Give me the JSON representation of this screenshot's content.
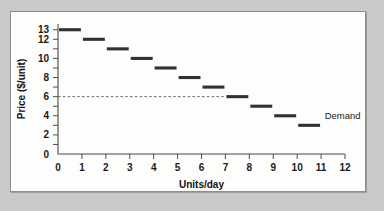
{
  "chart_data": {
    "type": "bar",
    "subtype": "step-demand-schedule",
    "title": "",
    "xlabel": "Units/day",
    "ylabel": "Price ($/unit)",
    "xlim": [
      0,
      12
    ],
    "ylim": [
      0,
      13.6
    ],
    "grid": false,
    "legend_position": "inline-right",
    "x_tick_labels": [
      "0",
      "1",
      "2",
      "3",
      "4",
      "5",
      "6",
      "7",
      "8",
      "9",
      "10",
      "11",
      "12"
    ],
    "x_ticks": [
      0,
      1,
      2,
      3,
      4,
      5,
      6,
      7,
      8,
      9,
      10,
      11,
      12
    ],
    "y_ticks": [
      1,
      2,
      3,
      4,
      5,
      6,
      7,
      8,
      9,
      10,
      11,
      12,
      13
    ],
    "y_tick_labels": [
      {
        "value": 13,
        "label": "13"
      },
      {
        "value": 12,
        "label": "12"
      },
      {
        "value": 10,
        "label": "10"
      },
      {
        "value": 8,
        "label": "8"
      },
      {
        "value": 6,
        "label": "6"
      },
      {
        "value": 4,
        "label": "4"
      },
      {
        "value": 2,
        "label": "2"
      },
      {
        "value": 0,
        "label": "0"
      }
    ],
    "series": [
      {
        "name": "Demand",
        "color": "#33312f",
        "categories": [
          1,
          2,
          3,
          4,
          5,
          6,
          7,
          8,
          9,
          10,
          11
        ],
        "values": [
          13,
          12,
          11,
          10,
          9,
          8,
          7,
          6,
          5,
          4,
          3
        ],
        "steps": [
          {
            "unit": 1,
            "x_start": 0,
            "x_end": 1,
            "price": 13
          },
          {
            "unit": 2,
            "x_start": 1,
            "x_end": 2,
            "price": 12
          },
          {
            "unit": 3,
            "x_start": 2,
            "x_end": 3,
            "price": 11
          },
          {
            "unit": 4,
            "x_start": 3,
            "x_end": 4,
            "price": 10
          },
          {
            "unit": 5,
            "x_start": 4,
            "x_end": 5,
            "price": 9
          },
          {
            "unit": 6,
            "x_start": 5,
            "x_end": 6,
            "price": 8
          },
          {
            "unit": 7,
            "x_start": 6,
            "x_end": 7,
            "price": 7
          },
          {
            "unit": 8,
            "x_start": 7,
            "x_end": 8,
            "price": 6
          },
          {
            "unit": 9,
            "x_start": 8,
            "x_end": 9,
            "price": 5
          },
          {
            "unit": 10,
            "x_start": 9,
            "x_end": 10,
            "price": 4
          },
          {
            "unit": 11,
            "x_start": 10,
            "x_end": 11,
            "price": 3
          }
        ]
      }
    ],
    "annotations": [
      {
        "name": "price-reference-line",
        "type": "hline",
        "y": 6,
        "x_start": 0,
        "x_end": 7,
        "style": "dashed",
        "color": "#6d6d6d",
        "label": ""
      },
      {
        "name": "demand-curve-label",
        "type": "text",
        "text": "Demand",
        "x": 11.15,
        "y": 4.05
      }
    ]
  },
  "labels": {
    "y_axis_title": "Price ($/unit)",
    "x_axis_title": "Units/day",
    "series_label": "Demand"
  }
}
